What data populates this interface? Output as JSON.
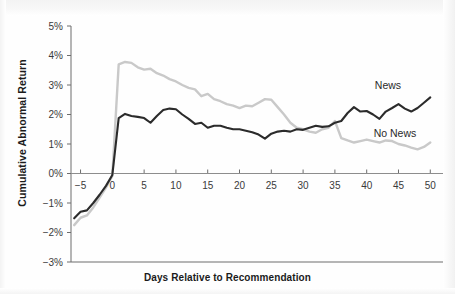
{
  "figure": {
    "background_color": "#fefefe",
    "ylabel": "Cumulative Abnormal Return",
    "xlabel": "Days Relative to Recommendation"
  },
  "series_labels": {
    "news": "News",
    "no_news": "No News"
  },
  "colors": {
    "news_line": "#2b2b2b",
    "no_news_line": "#c9c9c9",
    "axis": "#6d6d6d",
    "text": "#1b1b1b",
    "tick_text": "#3a3a3a"
  },
  "chart_data": {
    "type": "line",
    "title": "",
    "xlabel": "Days Relative to Recommendation",
    "ylabel": "Cumulative Abnormal Return",
    "xlim": [
      -6.5,
      52
    ],
    "ylim": [
      -3,
      5
    ],
    "grid": false,
    "legend": "inline-right",
    "xticks": [
      -5,
      0,
      5,
      10,
      15,
      20,
      25,
      30,
      35,
      40,
      45,
      50
    ],
    "xticklabels": [
      "-5",
      "0",
      "5",
      "10",
      "15",
      "20",
      "25",
      "30",
      "35",
      "40",
      "45",
      "50"
    ],
    "yticks": [
      -3,
      -2,
      -1,
      0,
      1,
      2,
      3,
      4,
      5
    ],
    "yticklabels": [
      "-3%",
      "-2%",
      "-1%",
      "0%",
      "1%",
      "2%",
      "3%",
      "4%",
      "5%"
    ],
    "zero_line": 0,
    "x": [
      -6,
      -5,
      -4,
      -3,
      -2,
      -1,
      0,
      1,
      2,
      3,
      4,
      5,
      6,
      7,
      8,
      9,
      10,
      11,
      12,
      13,
      14,
      15,
      16,
      17,
      18,
      19,
      20,
      21,
      22,
      23,
      24,
      25,
      26,
      27,
      28,
      29,
      30,
      31,
      32,
      33,
      34,
      35,
      36,
      37,
      38,
      39,
      40,
      41,
      42,
      43,
      44,
      45,
      46,
      47,
      48,
      49,
      50
    ],
    "series": [
      {
        "name": "News",
        "color": "#2b2b2b",
        "values": [
          -1.52,
          -1.3,
          -1.25,
          -1.0,
          -0.72,
          -0.42,
          -0.05,
          1.88,
          2.02,
          1.95,
          1.92,
          1.88,
          1.72,
          1.95,
          2.15,
          2.2,
          2.18,
          2.0,
          1.85,
          1.68,
          1.72,
          1.55,
          1.62,
          1.62,
          1.55,
          1.5,
          1.5,
          1.45,
          1.4,
          1.32,
          1.18,
          1.35,
          1.42,
          1.45,
          1.42,
          1.5,
          1.48,
          1.55,
          1.62,
          1.58,
          1.6,
          1.72,
          1.78,
          2.05,
          2.25,
          2.1,
          2.12,
          2.0,
          1.85,
          2.1,
          2.22,
          2.35,
          2.2,
          2.1,
          2.22,
          2.4,
          2.58
        ]
      },
      {
        "name": "No News",
        "color": "#c9c9c9",
        "values": [
          -1.75,
          -1.5,
          -1.42,
          -1.15,
          -0.82,
          -0.48,
          -0.08,
          3.7,
          3.78,
          3.75,
          3.6,
          3.52,
          3.55,
          3.4,
          3.32,
          3.2,
          3.12,
          3.0,
          2.9,
          2.85,
          2.62,
          2.7,
          2.52,
          2.45,
          2.35,
          2.3,
          2.22,
          2.3,
          2.28,
          2.4,
          2.52,
          2.5,
          2.25,
          2.0,
          1.72,
          1.55,
          1.5,
          1.42,
          1.38,
          1.5,
          1.55,
          1.78,
          1.2,
          1.12,
          1.05,
          1.1,
          1.15,
          1.1,
          1.05,
          1.12,
          1.1,
          1.0,
          0.95,
          0.88,
          0.82,
          0.9,
          1.05
        ]
      }
    ]
  }
}
